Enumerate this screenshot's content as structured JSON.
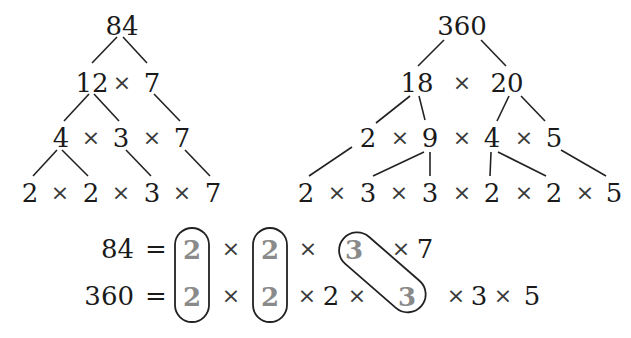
{
  "tree_84": {
    "root": "84",
    "level2": [
      "12",
      "×",
      "7"
    ],
    "level3": [
      "4",
      "×",
      "3",
      "×",
      "7"
    ],
    "level4": [
      "2",
      "×",
      "2",
      "×",
      "3",
      "×",
      "7"
    ]
  },
  "tree_360": {
    "root": "360",
    "level2": [
      "18",
      "×",
      "20"
    ],
    "level3": [
      "2",
      "×",
      "9",
      "×",
      "4",
      "×",
      "5"
    ],
    "level4": [
      "2",
      "×",
      "3",
      "×",
      "3",
      "×",
      "2",
      "×",
      "2",
      "×",
      "5"
    ]
  },
  "equations": {
    "row1": {
      "lhs": "84",
      "eq": "=",
      "terms": [
        "2",
        "×",
        "2",
        "×",
        "3",
        "×",
        "7"
      ]
    },
    "row2": {
      "lhs": "360",
      "eq": "=",
      "terms": [
        "2",
        "×",
        "2",
        "×",
        "2",
        "×",
        "3",
        "×",
        "3",
        "×",
        "5"
      ]
    }
  },
  "highlight": {
    "common_factors": [
      "2",
      "2",
      "3"
    ],
    "highlight_color": "#8a8a8a",
    "text_color": "#1a1a1a"
  }
}
